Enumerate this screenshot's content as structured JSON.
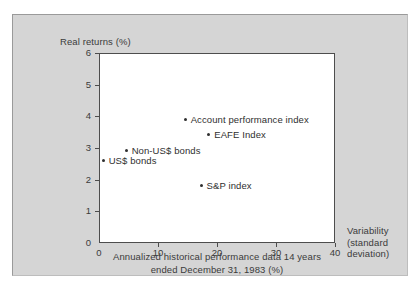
{
  "chart_data": {
    "type": "scatter",
    "title": "",
    "ylabel": "Real returns (%)",
    "xlabel": "Annualized historical performance data 14 years ended December 31, 1983 (%)",
    "x_right_label": "Variability (standard deviation)",
    "x_right_label_lines": [
      "Variability",
      "(standard",
      "deviation)"
    ],
    "xlim": [
      0,
      40
    ],
    "ylim": [
      0,
      6
    ],
    "xticks": [
      0,
      10,
      20,
      30,
      40
    ],
    "yticks": [
      0,
      1,
      2,
      3,
      4,
      5,
      6
    ],
    "xtick_labels": [
      "0",
      "10",
      "20",
      "30",
      "40"
    ],
    "ytick_labels": [
      "0",
      "1",
      "2",
      "3",
      "4",
      "5",
      "6"
    ],
    "grid": false,
    "legend": "none",
    "marker_color": "#2f2f2f",
    "points": [
      {
        "label": "Account performance index",
        "x": 14.6,
        "y": 3.9
      },
      {
        "label": "EAFE Index",
        "x": 18.6,
        "y": 3.4
      },
      {
        "label": "Non-US$ bonds",
        "x": 4.6,
        "y": 2.9
      },
      {
        "label": "US$ bonds",
        "x": 0.7,
        "y": 2.6
      },
      {
        "label": "S&P index",
        "x": 17.3,
        "y": 1.8
      }
    ]
  },
  "style": {
    "panel_background": "#d5d5d5",
    "plot_background": "#ffffff",
    "axis_color": "#4d4d4d",
    "text_color": "#3b3b3b"
  }
}
